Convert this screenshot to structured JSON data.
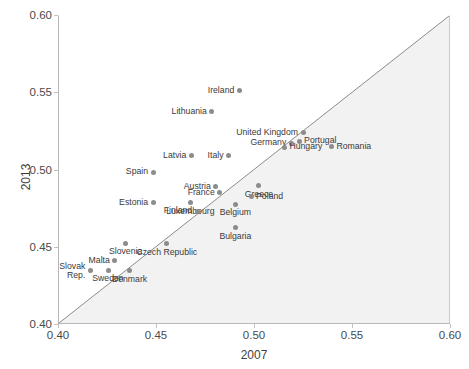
{
  "chart_data": {
    "type": "scatter",
    "title": "",
    "xlabel": "2007",
    "ylabel": "2013",
    "xlim": [
      0.4,
      0.6
    ],
    "ylim": [
      0.4,
      0.6
    ],
    "xticks": [
      "0.40",
      "0.45",
      "0.50",
      "0.55",
      "0.60"
    ],
    "yticks": [
      "0.40",
      "0.45",
      "0.50",
      "0.55",
      "0.60"
    ],
    "xtick_values": [
      0.4,
      0.45,
      0.5,
      0.55,
      0.6
    ],
    "ytick_values": [
      0.4,
      0.45,
      0.5,
      0.55,
      0.6
    ],
    "grid": false,
    "legend": "none",
    "reference_line": {
      "name": "45-degree identity line",
      "from": [
        0.4,
        0.4
      ],
      "to": [
        0.6,
        0.6
      ],
      "color": "#8a8a8a"
    },
    "shaded_region": {
      "name": "below-diagonal shading",
      "color": "#f2f2f2"
    },
    "marker_color": "#8c8c8c",
    "points": [
      {
        "label": "Ireland",
        "x": 0.492,
        "y": 0.5515,
        "label_pos": "r"
      },
      {
        "label": "Lithuania",
        "x": 0.478,
        "y": 0.538,
        "label_pos": "r"
      },
      {
        "label": "United Kingdom",
        "x": 0.5245,
        "y": 0.5245,
        "label_pos": "r"
      },
      {
        "label": "Germany",
        "x": 0.5185,
        "y": 0.5175,
        "label_pos": "r"
      },
      {
        "label": "Portugal",
        "x": 0.5225,
        "y": 0.519,
        "label_pos": "l"
      },
      {
        "label": "Hungary",
        "x": 0.515,
        "y": 0.515,
        "label_pos": "l"
      },
      {
        "label": "Romania",
        "x": 0.539,
        "y": 0.5155,
        "label_pos": "l"
      },
      {
        "label": "Latvia",
        "x": 0.4675,
        "y": 0.5095,
        "label_pos": "r"
      },
      {
        "label": "Italy",
        "x": 0.4865,
        "y": 0.5095,
        "label_pos": "r"
      },
      {
        "label": "Spain",
        "x": 0.448,
        "y": 0.499,
        "label_pos": "r"
      },
      {
        "label": "Greece",
        "x": 0.502,
        "y": 0.49,
        "label_pos": "c"
      },
      {
        "label": "Austria",
        "x": 0.48,
        "y": 0.4895,
        "label_pos": "r"
      },
      {
        "label": "France",
        "x": 0.482,
        "y": 0.4855,
        "label_pos": "r"
      },
      {
        "label": "Poland",
        "x": 0.498,
        "y": 0.483,
        "label_pos": "l"
      },
      {
        "label": "Luxembourg",
        "x": 0.467,
        "y": 0.479,
        "label_pos": "c"
      },
      {
        "label": "Estonia",
        "x": 0.448,
        "y": 0.479,
        "label_pos": "r"
      },
      {
        "label": "Belgium",
        "x": 0.49,
        "y": 0.478,
        "label_pos": "c"
      },
      {
        "label": "Finland",
        "x": 0.4705,
        "y": 0.4735,
        "label_pos": "r"
      },
      {
        "label": "Bulgaria",
        "x": 0.49,
        "y": 0.463,
        "label_pos": "c"
      },
      {
        "label": "Slovenia",
        "x": 0.434,
        "y": 0.453,
        "label_pos": "c"
      },
      {
        "label": "Czech Republic",
        "x": 0.455,
        "y": 0.4525,
        "label_pos": "c"
      },
      {
        "label": "Malta",
        "x": 0.4285,
        "y": 0.4415,
        "label_pos": "r"
      },
      {
        "label": "Slovak\nRep.",
        "x": 0.416,
        "y": 0.435,
        "label_pos": "r"
      },
      {
        "label": "Sweden",
        "x": 0.425,
        "y": 0.4355,
        "label_pos": "c"
      },
      {
        "label": "Denmark",
        "x": 0.436,
        "y": 0.435,
        "label_pos": "c"
      }
    ]
  },
  "axes": {
    "x_title": "2007",
    "y_title": "2013"
  }
}
